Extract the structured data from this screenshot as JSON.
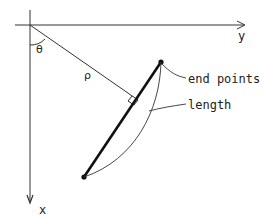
{
  "diagram": {
    "axes": {
      "x_label": "x",
      "y_label": "y"
    },
    "angle_label": "θ",
    "distance_label": "ρ",
    "annotations": {
      "end_points": "end points",
      "length": "length"
    },
    "colors": {
      "line": "#222222",
      "background": "#ffffff"
    }
  }
}
